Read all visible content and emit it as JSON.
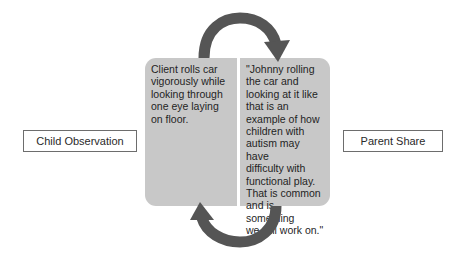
{
  "diagram": {
    "left_label": "Child Observation",
    "right_label": "Parent Share",
    "left_panel_text": "Client rolls car\nvigorously while\nlooking through\none eye laying\non floor.",
    "right_panel_text": "\"Johnny rolling\nthe car and\nlooking at it like\nthat is an\nexample of how\nchildren with\nautism may have\ndifficulty with\nfunctional play.\nThat is common\nand is something\nwe will work on.\"",
    "arrows": [
      {
        "name": "top-arrow",
        "direction": "clockwise",
        "from": "left-panel",
        "to": "right-panel"
      },
      {
        "name": "bottom-arrow",
        "direction": "clockwise",
        "from": "right-panel",
        "to": "left-panel"
      }
    ],
    "colors": {
      "panel_fill": "#c8c8c8",
      "arrow": "#555555",
      "label_border": "#6d6d6d"
    }
  }
}
